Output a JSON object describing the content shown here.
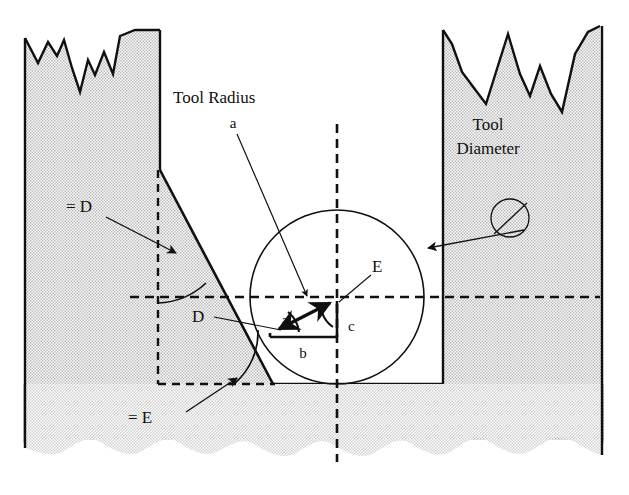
{
  "figure": {
    "type": "engineering-diagram",
    "background_color": "#ffffff",
    "hatch_color": "#c9c9c9",
    "line_color": "#101010",
    "canvas": {
      "width": 629,
      "height": 495
    }
  },
  "labels": {
    "tool_radius": "Tool Radius",
    "tool_diameter_line1": "Tool",
    "tool_diameter_line2": "Diameter",
    "angle_equals_d": "= D",
    "angle_equals_e": "= E",
    "vertex_d": "D",
    "vertex_e": "E",
    "side_a": "a",
    "side_b": "b",
    "side_c": "c"
  },
  "geometry": {
    "circle": {
      "cx": 337,
      "cy": 297,
      "r": 87,
      "name": "tool-circle"
    },
    "triangle": {
      "apex": {
        "x": 337,
        "y": 299
      },
      "left_vertex": {
        "x": 270,
        "y": 333
      },
      "base_right": {
        "x": 337,
        "y": 337
      },
      "sides": [
        "a",
        "b",
        "c"
      ]
    },
    "slanted_wall": {
      "x1": 160,
      "y1": 170,
      "x2": 273,
      "y2": 384
    },
    "right_wall_x": 443,
    "floor_y": 384,
    "centerline_x": 337,
    "datum_y": 297,
    "dashed_box": {
      "left": 158,
      "top": 170,
      "bottom": 384
    },
    "tool_diameter_marker": {
      "cx": 510,
      "cy": 218,
      "r": 20
    }
  },
  "annotations": [
    {
      "name": "tool-radius-leader",
      "from": "Tool Radius / a",
      "points_to": "hypotenuse a of triangle"
    },
    {
      "name": "tool-diameter-leader",
      "from": "Tool Diameter",
      "points_to": "tool circle edge"
    },
    {
      "name": "angle-d-leader",
      "from": "= D",
      "points_to": "arc between vertical datum and slanted wall"
    },
    {
      "name": "angle-e-leader",
      "from": "= E",
      "points_to": "arc at base of slanted wall"
    },
    {
      "name": "vertex-d-leader",
      "from": "D",
      "points_to": "angle arc at left triangle vertex"
    },
    {
      "name": "vertex-e-leader",
      "from": "E",
      "points_to": "angle arc at triangle apex"
    }
  ]
}
